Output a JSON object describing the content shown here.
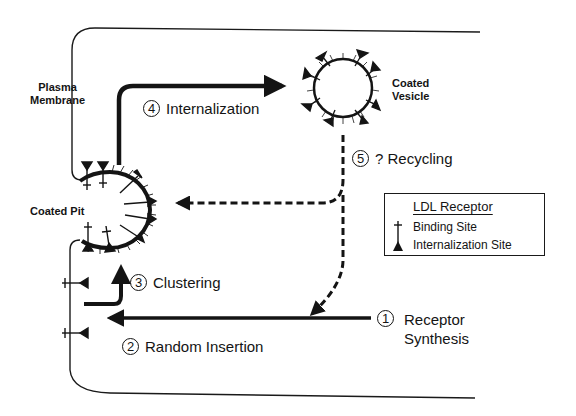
{
  "diagram": {
    "type": "LDL receptor pathway schematic",
    "labels": {
      "plasma_membrane": [
        "Plasma",
        "Membrane"
      ],
      "coated_pit": "Coated Pit",
      "coated_vesicle": [
        "Coated",
        "Vesicle"
      ]
    },
    "steps": [
      {
        "number": "1",
        "label": "Receptor",
        "label2": "Synthesis"
      },
      {
        "number": "2",
        "label": "Random Insertion"
      },
      {
        "number": "3",
        "label": "Clustering"
      },
      {
        "number": "4",
        "label": "Internalization"
      },
      {
        "number": "5",
        "label": "? Recycling"
      }
    ],
    "legend": {
      "title": "LDL Receptor",
      "items": [
        {
          "symbol": "cross-tick",
          "label": "Binding Site"
        },
        {
          "symbol": "filled-triangle",
          "label": "Internalization Site"
        }
      ]
    },
    "colors": {
      "ink": "#141414",
      "background": "#ffffff"
    }
  }
}
